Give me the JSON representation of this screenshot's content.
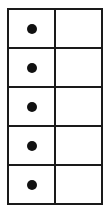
{
  "diagram": {
    "type": "grid",
    "rows": 5,
    "columns": 2,
    "cells": [
      {
        "left": "dot",
        "right": ""
      },
      {
        "left": "dot",
        "right": ""
      },
      {
        "left": "dot",
        "right": ""
      },
      {
        "left": "dot",
        "right": ""
      },
      {
        "left": "dot",
        "right": ""
      }
    ],
    "colors": {
      "line": "#1a1a1a",
      "dot": "#111111",
      "background": "#ffffff"
    }
  }
}
